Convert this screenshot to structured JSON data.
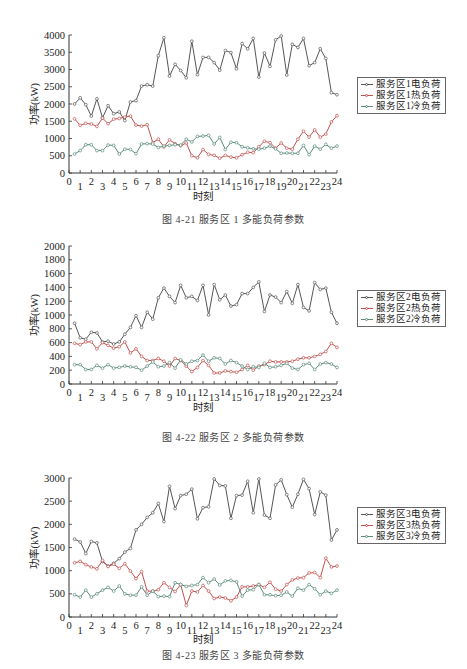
{
  "figures": [
    {
      "caption": "图 4-21    服务区 1 多能负荷参数",
      "legend": [
        "服务区1电负荷",
        "服务区1热负荷",
        "服务区1冷负荷"
      ]
    },
    {
      "caption": "图 4-22    服务区 2 多能负荷参数",
      "legend": [
        "服务区2电负荷",
        "服务区2热负荷",
        "服务区2冷负荷"
      ]
    },
    {
      "caption": "图 4-23    服务区 3 多能负荷参数",
      "legend": [
        "服务区3电负荷",
        "服务区3热负荷",
        "服务区3冷负荷"
      ]
    }
  ],
  "colors": {
    "electric": "#555555",
    "heat": "#c0504d",
    "cold": "#5a8a7a",
    "axis": "#333333"
  },
  "chart_data": [
    {
      "type": "line",
      "title": "图 4-21 服务区 1 多能负荷参数",
      "xlabel": "时刻",
      "ylabel": "功率(kW)",
      "ylim": [
        0,
        4000
      ],
      "yticks": [
        0,
        500,
        1000,
        1500,
        2000,
        2500,
        3000,
        3500,
        4000
      ],
      "xlim": [
        0,
        24
      ],
      "xticks": [
        0,
        1,
        2,
        3,
        4,
        5,
        6,
        7,
        8,
        9,
        10,
        11,
        12,
        13,
        14,
        15,
        16,
        17,
        18,
        19,
        20,
        21,
        22,
        23,
        24
      ],
      "legend_position": "right",
      "grid": false,
      "x": [
        0.5,
        1,
        1.5,
        2,
        2.5,
        3,
        3.5,
        4,
        4.5,
        5,
        5.5,
        6,
        6.5,
        7,
        7.5,
        8,
        8.5,
        9,
        9.5,
        10,
        10.5,
        11,
        11.5,
        12,
        12.5,
        13,
        13.5,
        14,
        14.5,
        15,
        15.5,
        16,
        16.5,
        17,
        17.5,
        18,
        18.5,
        19,
        19.5,
        20,
        20.5,
        21,
        21.5,
        22,
        22.5,
        23,
        23.5,
        24
      ],
      "series": [
        {
          "name": "服务区1电负荷",
          "values": [
            2000,
            2180,
            1980,
            1650,
            2150,
            1600,
            1950,
            1720,
            1770,
            1520,
            2060,
            2100,
            2520,
            2560,
            2520,
            3400,
            3920,
            2810,
            3150,
            2970,
            2760,
            3820,
            2850,
            3350,
            3350,
            3200,
            2980,
            3550,
            3490,
            3020,
            3750,
            3600,
            3900,
            2780,
            3480,
            3090,
            3860,
            3970,
            2840,
            3730,
            3640,
            3900,
            3110,
            3200,
            3600,
            3320,
            2330,
            2270
          ]
        },
        {
          "name": "服务区1热负荷",
          "values": [
            1570,
            1380,
            1440,
            1420,
            1350,
            1590,
            1430,
            1560,
            1580,
            1620,
            1650,
            1390,
            1360,
            1400,
            880,
            980,
            760,
            960,
            850,
            790,
            870,
            500,
            440,
            680,
            540,
            510,
            430,
            510,
            460,
            440,
            530,
            600,
            590,
            760,
            920,
            880,
            720,
            870,
            720,
            690,
            980,
            1210,
            1040,
            1250,
            1040,
            1130,
            1480,
            1660
          ],
          "_note": "last point 1360"
        },
        {
          "name": "服务区1冷负荷",
          "values": [
            550,
            650,
            820,
            820,
            650,
            650,
            810,
            800,
            550,
            690,
            680,
            560,
            840,
            850,
            840,
            740,
            780,
            800,
            820,
            810,
            980,
            900,
            1060,
            1070,
            1090,
            840,
            1030,
            680,
            890,
            880,
            760,
            730,
            700,
            690,
            720,
            780,
            700,
            570,
            580,
            570,
            570,
            800,
            530,
            780,
            690,
            830,
            720,
            780
          ]
        }
      ]
    },
    {
      "type": "line",
      "title": "图 4-22 服务区 2 多能负荷参数",
      "xlabel": "时刻",
      "ylabel": "功率(kW)",
      "ylim": [
        0,
        2000
      ],
      "yticks": [
        0,
        200,
        400,
        600,
        800,
        1000,
        1200,
        1400,
        1600,
        1800,
        2000
      ],
      "xlim": [
        0,
        24
      ],
      "xticks": [
        0,
        1,
        2,
        3,
        4,
        5,
        6,
        7,
        8,
        9,
        10,
        11,
        12,
        13,
        14,
        15,
        16,
        17,
        18,
        19,
        20,
        21,
        22,
        23,
        24
      ],
      "legend_position": "right",
      "grid": false,
      "x": [
        0.5,
        1,
        1.5,
        2,
        2.5,
        3,
        3.5,
        4,
        4.5,
        5,
        5.5,
        6,
        6.5,
        7,
        7.5,
        8,
        8.5,
        9,
        9.5,
        10,
        10.5,
        11,
        11.5,
        12,
        12.5,
        13,
        13.5,
        14,
        14.5,
        15,
        15.5,
        16,
        16.5,
        17,
        17.5,
        18,
        18.5,
        19,
        19.5,
        20,
        20.5,
        21,
        21.5,
        22,
        22.5,
        23,
        23.5,
        24
      ],
      "series": [
        {
          "name": "服务区2电负荷",
          "values": [
            880,
            670,
            650,
            750,
            740,
            610,
            620,
            580,
            610,
            720,
            820,
            990,
            820,
            1040,
            940,
            1250,
            1390,
            1270,
            1180,
            1430,
            1250,
            1270,
            1210,
            1430,
            1000,
            1440,
            1220,
            1290,
            1130,
            1150,
            1310,
            1310,
            1400,
            1480,
            1050,
            1290,
            1260,
            1180,
            1340,
            1170,
            1440,
            1110,
            1060,
            1470,
            1370,
            1390,
            1040,
            880
          ]
        },
        {
          "name": "服务区2热负荷",
          "values": [
            590,
            570,
            610,
            610,
            510,
            600,
            560,
            520,
            540,
            610,
            450,
            510,
            400,
            340,
            340,
            370,
            330,
            260,
            370,
            340,
            260,
            180,
            240,
            340,
            270,
            160,
            160,
            190,
            180,
            170,
            210,
            270,
            200,
            260,
            280,
            330,
            320,
            320,
            320,
            330,
            360,
            380,
            380,
            400,
            430,
            470,
            590,
            530,
            610
          ]
        },
        {
          "name": "服务区2冷负荷",
          "values": [
            280,
            280,
            210,
            210,
            270,
            230,
            280,
            230,
            240,
            260,
            250,
            240,
            200,
            260,
            320,
            250,
            260,
            310,
            230,
            350,
            290,
            330,
            340,
            420,
            330,
            380,
            370,
            290,
            340,
            310,
            260,
            210,
            250,
            240,
            300,
            240,
            250,
            270,
            300,
            230,
            210,
            280,
            300,
            210,
            290,
            310,
            290,
            240
          ]
        }
      ]
    },
    {
      "type": "line",
      "title": "图 4-23 服务区 3 多能负荷参数",
      "xlabel": "时刻",
      "ylabel": "功率(kW)",
      "ylim": [
        0,
        3000
      ],
      "yticks": [
        0,
        500,
        1000,
        1500,
        2000,
        2500,
        3000
      ],
      "xlim": [
        0,
        24
      ],
      "xticks": [
        0,
        1,
        2,
        3,
        4,
        5,
        6,
        7,
        8,
        9,
        10,
        11,
        12,
        13,
        14,
        15,
        16,
        17,
        18,
        19,
        20,
        21,
        22,
        23,
        24
      ],
      "legend_position": "right",
      "grid": false,
      "x": [
        0.5,
        1,
        1.5,
        2,
        2.5,
        3,
        3.5,
        4,
        4.5,
        5,
        5.5,
        6,
        6.5,
        7,
        7.5,
        8,
        8.5,
        9,
        9.5,
        10,
        10.5,
        11,
        11.5,
        12,
        12.5,
        13,
        13.5,
        14,
        14.5,
        15,
        15.5,
        16,
        16.5,
        17,
        17.5,
        18,
        18.5,
        19,
        19.5,
        20,
        20.5,
        21,
        21.5,
        22,
        22.5,
        23,
        23.5,
        24
      ],
      "series": [
        {
          "name": "服务区3电负荷",
          "values": [
            1680,
            1620,
            1370,
            1630,
            1600,
            1200,
            1100,
            1160,
            1260,
            1400,
            1480,
            1880,
            2000,
            2150,
            2250,
            2450,
            2060,
            2820,
            2340,
            2620,
            2650,
            2760,
            2120,
            2360,
            2380,
            2980,
            2840,
            2830,
            2130,
            2620,
            2630,
            2930,
            2250,
            2980,
            2200,
            2130,
            2850,
            2960,
            2640,
            2370,
            2650,
            2970,
            2770,
            2210,
            2700,
            2630,
            1660,
            1880
          ]
        },
        {
          "name": "服务区3热负荷",
          "values": [
            1170,
            1200,
            1130,
            1080,
            1040,
            1220,
            1090,
            1140,
            1050,
            1150,
            990,
            830,
            980,
            560,
            560,
            590,
            740,
            640,
            550,
            700,
            250,
            560,
            540,
            680,
            560,
            400,
            430,
            410,
            350,
            430,
            650,
            650,
            670,
            700,
            640,
            750,
            600,
            560,
            700,
            800,
            840,
            850,
            950,
            960,
            850,
            1270,
            1080,
            1100
          ]
        },
        {
          "name": "服务区3冷负荷",
          "values": [
            480,
            430,
            580,
            430,
            500,
            580,
            640,
            560,
            670,
            500,
            470,
            470,
            650,
            470,
            560,
            440,
            450,
            440,
            740,
            700,
            660,
            680,
            700,
            850,
            740,
            820,
            690,
            780,
            790,
            760,
            450,
            580,
            590,
            700,
            480,
            480,
            460,
            470,
            540,
            450,
            620,
            580,
            700,
            610,
            480,
            560,
            510,
            580
          ]
        }
      ]
    }
  ],
  "footer_text": "……"
}
